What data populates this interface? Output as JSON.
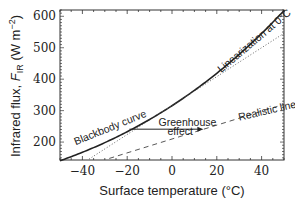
{
  "chart_data": {
    "type": "line",
    "title": "",
    "xlabel": "Surface temperature (°C)",
    "ylabel": "Infrared flux, F_IR (W m^-2)",
    "ylabel_parts": {
      "prefix": "Infrared flux, ",
      "symbol": "F",
      "subscript": "IR",
      "units_open": " (W m",
      "units_exp": "−2",
      "units_close": ")"
    },
    "xlim": [
      -50,
      50
    ],
    "ylim": [
      143,
      620
    ],
    "xticks": [
      -40,
      -20,
      0,
      20,
      40
    ],
    "xtick_labels": [
      "−40",
      "−20",
      "0",
      "20",
      "40"
    ],
    "yticks": [
      200,
      300,
      400,
      500,
      600
    ],
    "ytick_labels": [
      "200",
      "300",
      "400",
      "500",
      "600"
    ],
    "grid": false,
    "legend": null,
    "series": [
      {
        "name": "Blackbody curve",
        "style": "solid",
        "x": [
          -50,
          -40,
          -30,
          -20,
          -10,
          0,
          10,
          20,
          30,
          40,
          50
        ],
        "y": [
          140,
          167,
          198,
          233,
          272,
          316,
          364,
          418,
          478,
          544,
          618
        ]
      },
      {
        "name": "Linearization at 0°C",
        "style": "dotted",
        "x": [
          -37,
          50
        ],
        "y": [
          146,
          546
        ]
      },
      {
        "name": "Realistic linearization",
        "style": "dashed",
        "x": [
          -28,
          50
        ],
        "y": [
          148,
          320
        ]
      }
    ],
    "annotations": [
      {
        "text": "Blackbody curve",
        "x": -43,
        "y": 190,
        "rotation": -22
      },
      {
        "text": "Linearization at 0°C",
        "x": 22,
        "y": 420,
        "rotation": -40
      },
      {
        "text": "Realistic linearization",
        "x": 30,
        "y": 268,
        "rotation": -13
      },
      {
        "text": "Greenhouse",
        "x": -6,
        "y": 252,
        "rotation": 0
      },
      {
        "text": "effect",
        "x": -2,
        "y": 224,
        "rotation": 0
      },
      {
        "type": "arrow",
        "label": "Greenhouse effect",
        "from": [
          -19,
          241
        ],
        "to": [
          14,
          241
        ]
      }
    ]
  }
}
